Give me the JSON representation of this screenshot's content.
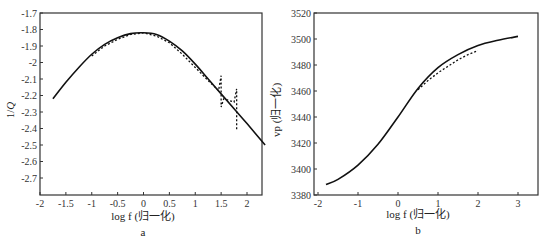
{
  "chart_data": [
    {
      "id": "a",
      "type": "line",
      "panel_label": "a",
      "title": "",
      "xlabel": "log f (归一化)",
      "ylabel": "1/Q",
      "xlim": [
        -2,
        2.35
      ],
      "ylim": [
        -2.8,
        -1.7
      ],
      "xticks": [
        -2,
        -1.5,
        -1,
        -0.5,
        0,
        0.5,
        1,
        1.5,
        2
      ],
      "xtick_labels": [
        "-2",
        "-1.5",
        "-1",
        "-0.5",
        "0",
        "0.5",
        "1",
        "1.5",
        "2"
      ],
      "yticks": [
        -1.7,
        -1.8,
        -1.9,
        -2,
        -2.1,
        -2.2,
        -2.3,
        -2.4,
        -2.5,
        -2.6,
        -2.7
      ],
      "ytick_labels": [
        "-1.7",
        "-1.8",
        "-1.9",
        "-2",
        "-2.1",
        "-2.2",
        "-2.3",
        "-2.4",
        "-2.5",
        "-2.6",
        "-2.7"
      ],
      "grid": false,
      "legend": null,
      "series": [
        {
          "name": "solid",
          "style": "solid",
          "x": [
            -1.75,
            -1.5,
            -1.25,
            -1.0,
            -0.75,
            -0.5,
            -0.25,
            0.0,
            0.25,
            0.5,
            0.75,
            1.0,
            1.25,
            1.5,
            1.75,
            2.0,
            2.35
          ],
          "y": [
            -2.22,
            -2.12,
            -2.03,
            -1.95,
            -1.89,
            -1.85,
            -1.825,
            -1.82,
            -1.83,
            -1.87,
            -1.93,
            -2.01,
            -2.1,
            -2.19,
            -2.28,
            -2.37,
            -2.5
          ]
        },
        {
          "name": "dashed",
          "style": "dashed",
          "x": [
            -1.0,
            -0.75,
            -0.5,
            -0.25,
            0.0,
            0.25,
            0.5,
            0.75,
            1.0,
            1.25,
            1.45,
            1.5,
            1.5,
            1.55,
            1.75,
            1.8,
            1.8
          ],
          "y": [
            -1.96,
            -1.9,
            -1.86,
            -1.83,
            -1.82,
            -1.84,
            -1.88,
            -1.95,
            -2.03,
            -2.11,
            -2.17,
            -2.08,
            -2.27,
            -2.22,
            -2.24,
            -2.16,
            -2.41
          ]
        }
      ]
    },
    {
      "id": "b",
      "type": "line",
      "panel_label": "b",
      "title": "",
      "xlabel": "log f (归一化)",
      "ylabel": "vp (归一化)",
      "xlim": [
        -2.1,
        3.5
      ],
      "ylim": [
        3380,
        3520
      ],
      "xticks": [
        -2,
        -1,
        0,
        1,
        2,
        3
      ],
      "xtick_labels": [
        "-2",
        "-1",
        "0",
        "1",
        "2",
        "3"
      ],
      "yticks": [
        3380,
        3400,
        3420,
        3440,
        3460,
        3480,
        3500,
        3520
      ],
      "ytick_labels": [
        "3380",
        "3400",
        "3420",
        "3440",
        "3460",
        "3480",
        "3500",
        "3520"
      ],
      "grid": false,
      "legend": null,
      "series": [
        {
          "name": "solid",
          "style": "solid",
          "x": [
            -1.8,
            -1.5,
            -1.0,
            -0.5,
            0.0,
            0.5,
            1.0,
            1.5,
            2.0,
            2.5,
            3.0
          ],
          "y": [
            3388,
            3392,
            3403,
            3419,
            3440,
            3462,
            3478,
            3488,
            3495,
            3499,
            3502
          ]
        },
        {
          "name": "dashed",
          "style": "dashed",
          "x": [
            0.5,
            0.75,
            1.0,
            1.25,
            1.5,
            1.75,
            2.0
          ],
          "y": [
            3461,
            3468,
            3474,
            3479,
            3484,
            3488,
            3491
          ]
        }
      ]
    }
  ],
  "panels": {
    "a": {
      "label": "a",
      "xlabel": "log f (归一化)",
      "ylabel": "1/Q"
    },
    "b": {
      "label": "b",
      "xlabel": "log f (归一化)",
      "ylabel": "vp (归一化)"
    }
  }
}
